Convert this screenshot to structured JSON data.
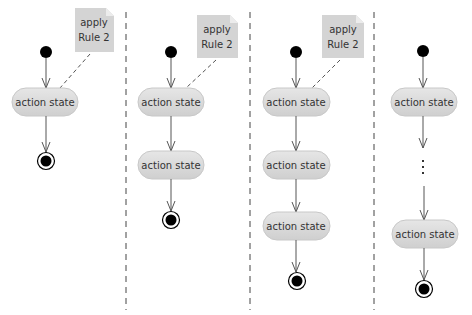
{
  "diagram": {
    "type": "UML activity diagram – Rule 2 application sequence",
    "colors": {
      "state_fill": "#d9d9d9",
      "state_stroke": "#c4c4c4",
      "note_fill": "#d4d4d4",
      "line": "#555555",
      "node": "#000000",
      "divider": "#333333"
    },
    "panels": [
      {
        "note": {
          "line1": "apply",
          "line2": "Rule 2"
        },
        "states": [
          {
            "label": "action state"
          }
        ],
        "has_ellipsis": false
      },
      {
        "note": {
          "line1": "apply",
          "line2": "Rule 2"
        },
        "states": [
          {
            "label": "action state"
          },
          {
            "label": "action state"
          }
        ],
        "has_ellipsis": false
      },
      {
        "note": {
          "line1": "apply",
          "line2": "Rule 2"
        },
        "states": [
          {
            "label": "action state"
          },
          {
            "label": "action state"
          },
          {
            "label": "action state"
          }
        ],
        "has_ellipsis": false
      },
      {
        "note": null,
        "states": [
          {
            "label": "action state"
          },
          {
            "label": "action state"
          }
        ],
        "has_ellipsis": true,
        "ellipsis": "⋮"
      }
    ]
  }
}
